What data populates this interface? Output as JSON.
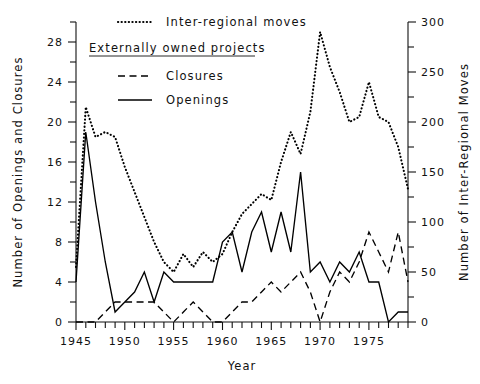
{
  "chart_data": {
    "type": "line",
    "title": "",
    "xlabel": "Year",
    "ylabel": "Number of Openings and Closures",
    "y2label": "Number of Inter-Regional Moves",
    "xlim": [
      1945,
      1979
    ],
    "ylim": [
      0,
      30
    ],
    "y2lim": [
      0,
      300
    ],
    "grid": false,
    "legend_position": "top-left-inside",
    "x_tick_labels": [
      "1945",
      "1950",
      "1955",
      "1960",
      "1965",
      "1970",
      "1975"
    ],
    "x_tick_values": [
      1945,
      1950,
      1955,
      1960,
      1965,
      1970,
      1975
    ],
    "x_minor_tick_step": 1,
    "y_tick_labels": [
      "0",
      "4",
      "8",
      "12",
      "16",
      "20",
      "24",
      "28"
    ],
    "y_tick_values": [
      0,
      4,
      8,
      12,
      16,
      20,
      24,
      28
    ],
    "y_minor_tick_step": 2,
    "y2_tick_labels": [
      "0",
      "50",
      "100",
      "150",
      "200",
      "250",
      "300"
    ],
    "y2_tick_values": [
      0,
      50,
      100,
      150,
      200,
      250,
      300
    ],
    "y2_minor_tick_step": 25,
    "x": [
      1945,
      1946,
      1947,
      1948,
      1949,
      1950,
      1951,
      1952,
      1953,
      1954,
      1955,
      1956,
      1957,
      1958,
      1959,
      1960,
      1961,
      1962,
      1963,
      1964,
      1965,
      1966,
      1967,
      1968,
      1969,
      1970,
      1971,
      1972,
      1973,
      1974,
      1975,
      1976,
      1977,
      1978,
      1979
    ],
    "series": [
      {
        "name": "Inter-regional moves",
        "style": "dotted",
        "axis": "right",
        "units": "moves",
        "values": [
          55,
          215,
          185,
          190,
          185,
          155,
          130,
          105,
          80,
          60,
          50,
          68,
          55,
          70,
          60,
          68,
          90,
          108,
          118,
          128,
          122,
          160,
          190,
          168,
          210,
          290,
          255,
          230,
          200,
          205,
          240,
          205,
          200,
          175,
          133
        ]
      },
      {
        "name": "Closures",
        "style": "dashed",
        "axis": "left",
        "units": "closures",
        "values": [
          0,
          0,
          0,
          1,
          2,
          2,
          2,
          2,
          2,
          1,
          0,
          1,
          2,
          1,
          0,
          0,
          1,
          2,
          2,
          3,
          4,
          3,
          4,
          5,
          3,
          0,
          3,
          5,
          4,
          6,
          9,
          7,
          5,
          9,
          4
        ]
      },
      {
        "name": "Openings",
        "style": "solid",
        "axis": "left",
        "units": "openings",
        "values": [
          4,
          19,
          12,
          6,
          1,
          2,
          3,
          5,
          2,
          5,
          4,
          4,
          4,
          4,
          4,
          8,
          9,
          5,
          9,
          11,
          7,
          11,
          7,
          15,
          5,
          6,
          4,
          6,
          5,
          7,
          4,
          4,
          0,
          1,
          1
        ]
      }
    ],
    "legend": {
      "entries": [
        {
          "label": "Inter-regional moves",
          "style": "dotted"
        },
        {
          "label": "Externally owned projects",
          "style": "heading"
        },
        {
          "label": "Closures",
          "style": "dashed"
        },
        {
          "label": "Openings",
          "style": "solid"
        }
      ]
    }
  },
  "axes": {
    "x_title": "Year",
    "y_left_title": "Number of Openings and Closures",
    "y_right_title": "Number of Inter-Regional Moves"
  },
  "legend": {
    "moves_label": "Inter-regional moves",
    "group_label": "Externally owned projects",
    "closures_label": "Closures",
    "openings_label": "Openings"
  },
  "yleft": {
    "t0": "0",
    "t1": "4",
    "t2": "8",
    "t3": "12",
    "t4": "16",
    "t5": "20",
    "t6": "24",
    "t7": "28"
  },
  "yright": {
    "t0": "0",
    "t1": "50",
    "t2": "100",
    "t3": "150",
    "t4": "200",
    "t5": "250",
    "t6": "300"
  },
  "xaxis": {
    "t0": "1945",
    "t1": "1950",
    "t2": "1955",
    "t3": "1960",
    "t4": "1965",
    "t5": "1970",
    "t6": "1975"
  }
}
